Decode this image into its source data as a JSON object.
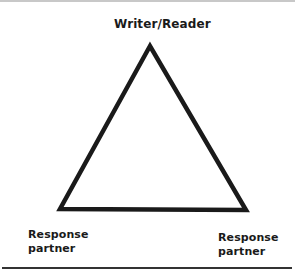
{
  "diagram": {
    "type": "triangle",
    "stroke_color": "#1a1a1a",
    "apex": {
      "label": "Writer/Reader"
    },
    "bottom_left": {
      "label_line1": "Response",
      "label_line2": "partner"
    },
    "bottom_right": {
      "label_line1": "Response",
      "label_line2": "partner"
    }
  }
}
